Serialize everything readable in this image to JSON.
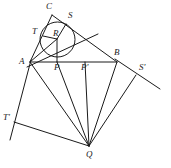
{
  "figure": {
    "kind": "geometry-diagram",
    "background_color": "#ffffff",
    "stroke_color": "#1a1a1a",
    "width": 171,
    "height": 168
  },
  "points": [
    {
      "id": "C",
      "label": "C",
      "x": 52,
      "y": 15,
      "label_x": 46,
      "label_y": 2
    },
    {
      "id": "S",
      "label": "S",
      "x": 66,
      "y": 24,
      "label_x": 68,
      "label_y": 11
    },
    {
      "id": "T",
      "label": "T",
      "x": 43,
      "y": 36,
      "label_x": 32,
      "label_y": 27
    },
    {
      "id": "R",
      "label": "R",
      "x": 57,
      "y": 39,
      "label_x": 53,
      "label_y": 29
    },
    {
      "id": "A",
      "label": "A",
      "x": 30,
      "y": 62,
      "label_x": 19,
      "label_y": 57
    },
    {
      "id": "P",
      "label": "P",
      "x": 57,
      "y": 62,
      "label_x": 54,
      "label_y": 63
    },
    {
      "id": "Pp",
      "label": "P'",
      "x": 85,
      "y": 62,
      "label_x": 81,
      "label_y": 63
    },
    {
      "id": "B",
      "label": "B",
      "x": 117,
      "y": 62,
      "label_x": 114,
      "label_y": 48
    },
    {
      "id": "Sp",
      "label": "S'",
      "x": 136,
      "y": 75,
      "label_x": 139,
      "label_y": 63
    },
    {
      "id": "Tp",
      "label": "T'",
      "x": 14,
      "y": 122,
      "label_x": 3,
      "label_y": 113
    },
    {
      "id": "Q",
      "label": "Q",
      "x": 89,
      "y": 146,
      "label_x": 86,
      "label_y": 150
    }
  ],
  "circle": {
    "id": "incircle",
    "center_x": 57.5,
    "center_y": 39.5,
    "radius": 17.5
  },
  "segments": [
    {
      "id": "AB-base",
      "x1": 30,
      "y1": 62,
      "x2": 117,
      "y2": 62
    },
    {
      "id": "AC-side",
      "x1": 30,
      "y1": 62,
      "x2": 52,
      "y2": 15
    },
    {
      "id": "CB-side",
      "x1": 52,
      "y1": 15,
      "x2": 117,
      "y2": 62
    },
    {
      "id": "A-through-T-ray",
      "x1": 27,
      "y1": 67,
      "x2": 98,
      "y2": 34
    },
    {
      "id": "R-to-P-radius",
      "x1": 57,
      "y1": 39,
      "x2": 57,
      "y2": 62
    },
    {
      "id": "R-to-T-radius",
      "x1": 57,
      "y1": 39,
      "x2": 43,
      "y2": 36
    },
    {
      "id": "R-to-S-radius",
      "x1": 57,
      "y1": 39,
      "x2": 66,
      "y2": 24
    },
    {
      "id": "R-to-A-line",
      "x1": 57,
      "y1": 39,
      "x2": 30,
      "y2": 62
    },
    {
      "id": "A-to-Tp-ray",
      "x1": 31,
      "y1": 60,
      "x2": 10,
      "y2": 140
    },
    {
      "id": "B-to-Sp-ray",
      "x1": 115,
      "y1": 59,
      "x2": 160,
      "y2": 89
    },
    {
      "id": "Tp-to-Q",
      "x1": 14,
      "y1": 122,
      "x2": 89,
      "y2": 146
    },
    {
      "id": "Q-to-A",
      "x1": 89,
      "y1": 146,
      "x2": 30,
      "y2": 62
    },
    {
      "id": "Q-to-P",
      "x1": 89,
      "y1": 146,
      "x2": 57,
      "y2": 62
    },
    {
      "id": "Q-to-Pp",
      "x1": 89,
      "y1": 146,
      "x2": 85,
      "y2": 62
    },
    {
      "id": "Q-to-B",
      "x1": 89,
      "y1": 146,
      "x2": 117,
      "y2": 62
    },
    {
      "id": "Q-to-Sp",
      "x1": 89,
      "y1": 146,
      "x2": 136,
      "y2": 75
    }
  ]
}
